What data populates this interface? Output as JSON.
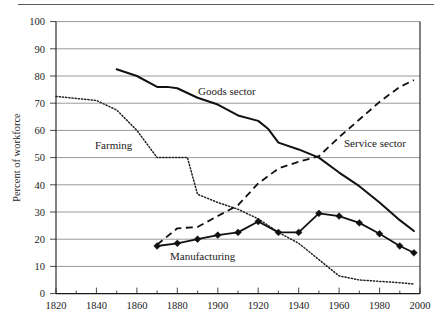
{
  "chart_data": {
    "type": "line",
    "title": "",
    "xlabel": "",
    "ylabel": "Percent of workforce",
    "xlim": [
      1820,
      2000
    ],
    "ylim": [
      0,
      100
    ],
    "xticks": [
      1820,
      1840,
      1860,
      1880,
      1900,
      1920,
      1940,
      1960,
      1980,
      2000
    ],
    "yticks": [
      0,
      10,
      20,
      30,
      40,
      50,
      60,
      70,
      80,
      90,
      100
    ],
    "grid": "horizontal",
    "legend": "inline-annotations",
    "series": [
      {
        "name": "Goods sector",
        "style": "solid-thick",
        "color": "#111111",
        "label_x": 1908,
        "label_y": 73,
        "x": [
          1850,
          1860,
          1870,
          1875,
          1880,
          1890,
          1900,
          1910,
          1920,
          1925,
          1930,
          1940,
          1950,
          1960,
          1970,
          1980,
          1990,
          1997
        ],
        "y": [
          82.5,
          80.0,
          76.0,
          76.0,
          75.5,
          72.0,
          69.5,
          65.5,
          63.5,
          60.5,
          55.5,
          53.0,
          50.0,
          44.5,
          39.5,
          33.5,
          27.0,
          23.0
        ]
      },
      {
        "name": "Service sector",
        "style": "dashed",
        "color": "#111111",
        "label_x": 1963,
        "label_y": 55,
        "x": [
          1870,
          1880,
          1890,
          1900,
          1910,
          1920,
          1930,
          1940,
          1950,
          1960,
          1970,
          1980,
          1990,
          1997
        ],
        "y": [
          18.0,
          24.0,
          24.5,
          28.5,
          32.5,
          40.5,
          46.0,
          48.5,
          50.5,
          57.5,
          64.0,
          70.5,
          76.0,
          78.5
        ]
      },
      {
        "name": "Farming",
        "style": "dotted",
        "color": "#222222",
        "label_x": 1857,
        "label_y": 56,
        "x": [
          1820,
          1840,
          1850,
          1860,
          1870,
          1880,
          1885,
          1890,
          1900,
          1910,
          1920,
          1930,
          1940,
          1950,
          1960,
          1970,
          1980,
          1990,
          1997
        ],
        "y": [
          72.5,
          71.0,
          67.5,
          60.0,
          50.0,
          50.0,
          50.0,
          36.5,
          33.5,
          31.0,
          27.5,
          22.5,
          18.5,
          12.5,
          6.5,
          5.0,
          4.5,
          4.0,
          3.5
        ]
      },
      {
        "name": "Manufacturing",
        "style": "solid-markers",
        "color": "#111111",
        "marker": "diamond",
        "label_x": 1896,
        "label_y": 13,
        "x": [
          1870,
          1880,
          1890,
          1900,
          1910,
          1920,
          1930,
          1940,
          1950,
          1960,
          1970,
          1980,
          1990,
          1997
        ],
        "y": [
          17.5,
          18.5,
          20.0,
          21.5,
          22.5,
          26.5,
          22.5,
          22.5,
          29.5,
          28.5,
          26.0,
          22.0,
          17.5,
          15.0
        ]
      }
    ]
  },
  "axis_labels": {
    "y_title": "Percent of workforce",
    "x_tick_texts": [
      "1820",
      "1840",
      "1860",
      "1880",
      "1900",
      "1920",
      "1940",
      "1960",
      "1980",
      "2000"
    ],
    "y_tick_texts": [
      "0",
      "10",
      "20",
      "30",
      "40",
      "50",
      "60",
      "70",
      "80",
      "90",
      "100"
    ]
  },
  "series_labels": {
    "goods": "Goods sector",
    "service": "Service sector",
    "farming": "Farming",
    "manufacturing": "Manufacturing"
  }
}
